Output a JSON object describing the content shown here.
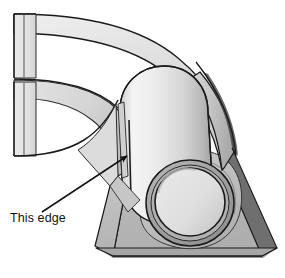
{
  "figure": {
    "type": "technical-illustration",
    "background_color": "#ffffff",
    "outline_color": "#1a1a1a"
  },
  "annotation": {
    "label": "This edge",
    "label_x": 10,
    "label_y": 222,
    "leader": {
      "from_x": 42,
      "from_y": 212,
      "to_x": 129,
      "to_y": 154,
      "arrowhead": "filled-triangle",
      "color": "#111111"
    }
  },
  "palette": {
    "outline": "#1a1a1a",
    "thin_edge": "#3a3a3a",
    "highlight": "#f2f2f2",
    "light_face": "#e2e2e2",
    "mid_face": "#c8c8c8",
    "base_face": "#b4b4b4",
    "dark_face": "#8f8f8f",
    "shadow_face": "#6a6a6a",
    "deep_shadow": "#4a4a4a",
    "bore_ring": "#9a9a9a",
    "bore_inner": "#d8d8d8",
    "text": "#111111"
  },
  "parts": [
    {
      "name": "elbow-outer-sweep",
      "shading": "gradient-light-to-mid"
    },
    {
      "name": "elbow-inner-sweep",
      "shading": "gradient-mid"
    },
    {
      "name": "left-cut-face",
      "shading": "flat-light"
    },
    {
      "name": "cylinder-boss",
      "shading": "gradient-highlight-left"
    },
    {
      "name": "bore-outer-ring",
      "shading": "ring-mid"
    },
    {
      "name": "bore-inner-hole",
      "shading": "gradient-light"
    },
    {
      "name": "base-plate-top",
      "shading": "flat-base"
    },
    {
      "name": "base-plate-front-bevel",
      "shading": "flat-mid"
    },
    {
      "name": "base-plate-right-bevel",
      "shading": "flat-dark"
    },
    {
      "name": "right-shadow-sliver",
      "shading": "flat-deep-shadow"
    },
    {
      "name": "counterbore-recess",
      "shading": "gradient-mid"
    }
  ]
}
